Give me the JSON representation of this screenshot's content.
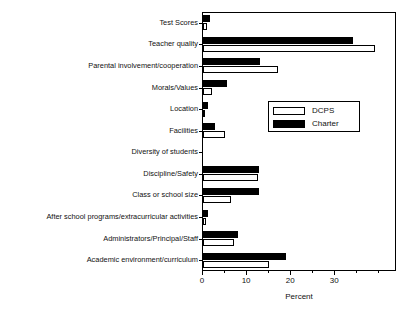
{
  "chart_data": {
    "type": "bar",
    "orientation": "horizontal",
    "title": "",
    "xlabel": "Percent",
    "ylabel": "",
    "xlim": [
      0,
      44
    ],
    "xticks": [
      0,
      10,
      20,
      30
    ],
    "xtick_labels": [
      "0",
      "10",
      "20",
      "30"
    ],
    "grid": false,
    "legend_position": "center-right",
    "categories": [
      "Test Scores",
      "Teacher quality",
      "Parental involvement/cooperation",
      "Morals/Values",
      "Location",
      "Facilities",
      "Diversity of students",
      "Discipline/Safety",
      "Class or school size",
      "After school programs/extracurricular activities",
      "Administrators/Principal/Staff",
      "Academic environment/curriculum"
    ],
    "series": [
      {
        "name": "DCPS",
        "color": "#ffffff",
        "values": [
          1.0,
          39.0,
          17.0,
          2.0,
          0.2,
          5.0,
          0.0,
          12.5,
          6.4,
          0.7,
          7.0,
          15.0
        ]
      },
      {
        "name": "Charter",
        "color": "#000000",
        "values": [
          1.6,
          34.0,
          13.0,
          5.5,
          1.2,
          2.8,
          0.0,
          12.7,
          12.7,
          1.2,
          8.0,
          18.9
        ]
      }
    ]
  },
  "legend": {
    "entries": [
      {
        "label": "DCPS",
        "swatch": "white-outlined"
      },
      {
        "label": "Charter",
        "swatch": "black-filled"
      }
    ]
  },
  "axis": {
    "x_title": "Percent"
  }
}
